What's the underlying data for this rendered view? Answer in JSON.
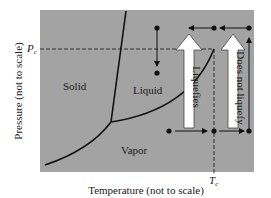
{
  "diagram": {
    "type": "phase-diagram",
    "colors": {
      "plot_bg": "#a3a3a3",
      "line": "#111111",
      "arrow_fill": "#ffffff",
      "text": "#1a1a1a"
    },
    "axes": {
      "xlabel": "Temperature (not to scale)",
      "ylabel": "Pressure (not to scale)",
      "x_marker": "T",
      "x_marker_sub": "c",
      "y_marker": "P",
      "y_marker_sub": "c"
    },
    "regions": {
      "solid": "Solid",
      "liquid": "Liquid",
      "vapor": "Vapor"
    },
    "arrows": {
      "liquefies": "Liquefies",
      "does_not_liquefy": "Does not liquefy"
    }
  }
}
